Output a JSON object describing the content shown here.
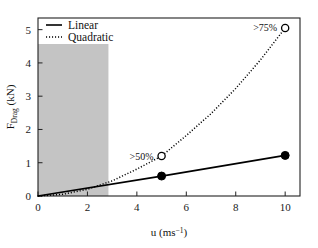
{
  "chart_data": {
    "type": "line",
    "title": "",
    "xlabel": "u (ms-1)",
    "xlabel_base": "u (ms",
    "xlabel_exponent": "−1",
    "xlabel_close": ")",
    "ylabel": "FDrag (kN)",
    "ylabel_base": "F",
    "ylabel_sub": "Drag",
    "ylabel_unit": " (kN)",
    "xlim": [
      0,
      10.6
    ],
    "ylim": [
      0,
      5.35
    ],
    "xticks": [
      0,
      2,
      4,
      6,
      8,
      10
    ],
    "xtick_labels": [
      "0",
      "2",
      "4",
      "6",
      "8",
      "10"
    ],
    "yticks": [
      0,
      1,
      2,
      3,
      4,
      5
    ],
    "ytick_labels": [
      "0",
      "1",
      "2",
      "3",
      "4",
      "5"
    ],
    "grid": false,
    "legend_position": "top-left",
    "series": [
      {
        "name": "Linear",
        "style": "solid",
        "marker": "filled-circle",
        "color": "#000000",
        "x": [
          0,
          5,
          10
        ],
        "values": [
          0,
          0.6,
          1.22
        ],
        "marker_points": [
          {
            "x": 5,
            "y": 0.6
          },
          {
            "x": 10,
            "y": 1.22
          }
        ]
      },
      {
        "name": "Quadratic",
        "style": "dotted",
        "marker": "open-circle",
        "color": "#000000",
        "x": [
          0,
          1,
          2,
          3,
          4,
          5,
          6,
          7,
          8,
          9,
          10
        ],
        "values": [
          0,
          0.0505,
          0.202,
          0.4545,
          0.808,
          1.2,
          1.818,
          2.4745,
          3.232,
          4.0905,
          5.05
        ],
        "marker_points": [
          {
            "x": 5,
            "y": 1.2
          },
          {
            "x": 10,
            "y": 5.05
          }
        ]
      }
    ],
    "shaded_region": {
      "x_start": 0,
      "x_end": 2.85,
      "color": "#c4c4c4"
    },
    "annotations": [
      {
        "text": ">50%",
        "x": 5,
        "y": 1.2,
        "anchor": "left-of-marker"
      },
      {
        "text": ">75%",
        "x": 10,
        "y": 5.05,
        "anchor": "left-of-marker"
      }
    ]
  },
  "legend": {
    "items": [
      {
        "label": "Linear",
        "style": "solid"
      },
      {
        "label": "Quadratic",
        "style": "dotted"
      }
    ]
  }
}
